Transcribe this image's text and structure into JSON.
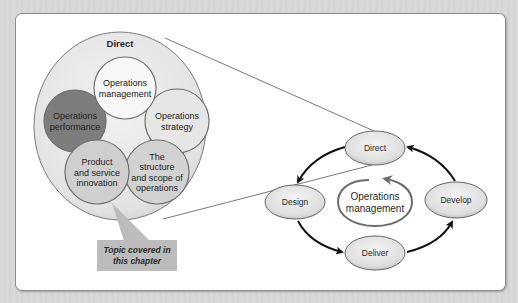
{
  "diagram": {
    "zoom_group": {
      "title": "Direct",
      "circles": [
        {
          "id": "operations-management",
          "lines": [
            "Operations",
            "management"
          ],
          "fill": "#f7f7f7"
        },
        {
          "id": "operations-performance",
          "lines": [
            "Operations",
            "performance"
          ],
          "fill": "#7d7d7d"
        },
        {
          "id": "operations-strategy",
          "lines": [
            "Operations",
            "strategy"
          ],
          "fill": "#e6e6e6"
        },
        {
          "id": "product-and-service-innovation",
          "lines": [
            "Product",
            "and service",
            "innovation"
          ],
          "fill": "#cfcfcf",
          "highlighted": true
        },
        {
          "id": "structure-and-scope",
          "lines": [
            "The",
            "structure",
            "and scope of",
            "operations"
          ],
          "fill": "#d2d2d2"
        }
      ]
    },
    "callout": {
      "lines": [
        "Topic covered in",
        "this chapter"
      ],
      "fill": "#bcbcbc"
    },
    "cycle": {
      "center_label": [
        "Operations",
        "management"
      ],
      "nodes": [
        {
          "id": "direct",
          "label": "Direct"
        },
        {
          "id": "develop",
          "label": "Develop"
        },
        {
          "id": "deliver",
          "label": "Deliver"
        },
        {
          "id": "design",
          "label": "Design"
        }
      ],
      "flow": [
        "Direct → Design",
        "Design → Deliver",
        "Deliver → Develop",
        "Develop → Direct"
      ]
    }
  }
}
